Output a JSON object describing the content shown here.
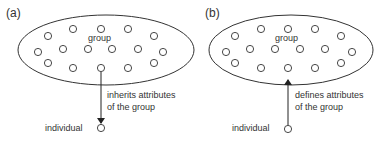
{
  "panels": [
    {
      "id": "a",
      "label": "(a)",
      "group_label": "group",
      "individual_label": "individual",
      "arrow_text_line1": "inherits attributes",
      "arrow_text_line2": "of the group",
      "arrow_direction": "group-to-individual"
    },
    {
      "id": "b",
      "label": "(b)",
      "group_label": "group",
      "individual_label": "individual",
      "arrow_text_line1": "defines attributes",
      "arrow_text_line2": "of the group",
      "arrow_direction": "individual-to-group"
    }
  ],
  "colors": {
    "stroke": "#333333",
    "background": "#ffffff"
  }
}
